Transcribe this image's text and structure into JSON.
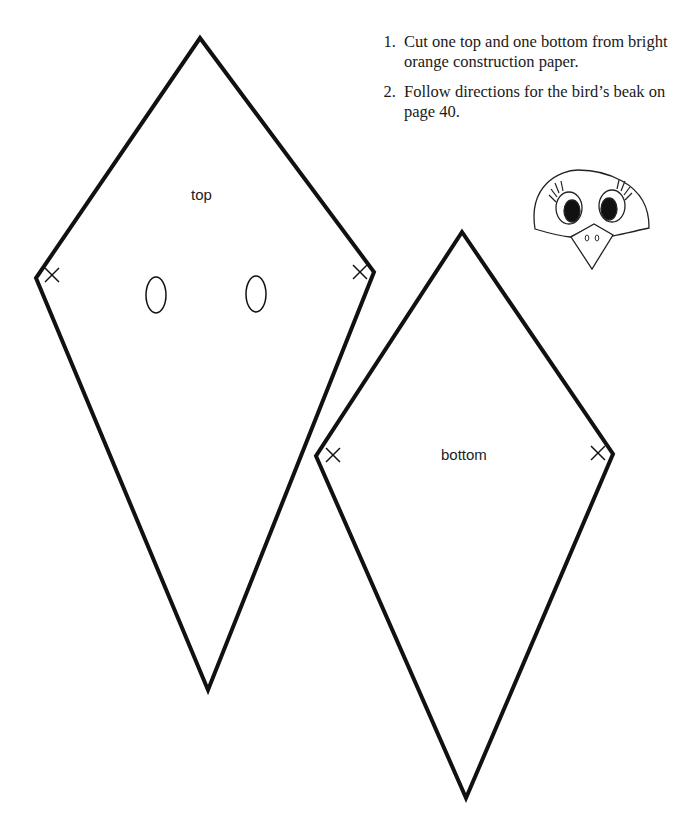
{
  "instructions": {
    "steps": [
      "Cut one top and one bottom from bright orange construction paper.",
      "Follow directions for the bird’s beak on page 40."
    ]
  },
  "pieces": {
    "top": {
      "label": "top"
    },
    "bottom": {
      "label": "bottom"
    }
  },
  "illustration": {
    "subject": "bird-face-with-beak"
  }
}
